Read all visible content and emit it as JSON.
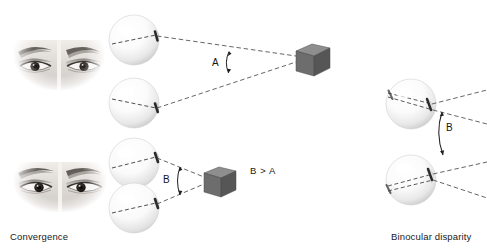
{
  "figure": {
    "background_color": "#ffffff",
    "width": 487,
    "height": 248
  },
  "panels": [
    {
      "id": "convergence",
      "caption": "Convergence",
      "caption_position": {
        "x": 10,
        "y": 231
      },
      "rows": [
        {
          "id": "far-target",
          "angle_label": "A",
          "angle_label_position": {
            "x": 212,
            "y": 57
          },
          "eye_photo": {
            "x": 14,
            "y": 18,
            "w": 90,
            "h": 72,
            "alt": "grayscale photograph of a pair of human eyes looking straight ahead"
          },
          "eyeballs": [
            {
              "cx": 134,
              "cy": 40,
              "r": 25
            },
            {
              "cx": 134,
              "cy": 103,
              "r": 25
            }
          ],
          "target_cube": {
            "x": 294,
            "y": 44,
            "size": 26
          }
        },
        {
          "id": "near-target",
          "angle_label": "B",
          "angle_label_position": {
            "x": 163,
            "y": 174
          },
          "eye_photo": {
            "x": 14,
            "y": 150,
            "w": 92,
            "h": 62,
            "alt": "grayscale photograph of a pair of human eyes converged on a near object"
          },
          "eyeballs": [
            {
              "cx": 134,
              "cy": 163,
              "r": 25
            },
            {
              "cx": 134,
              "cy": 208,
              "r": 25
            }
          ],
          "target_cube": {
            "x": 200,
            "y": 168,
            "size": 24
          }
        }
      ],
      "inequality_note": "B > A",
      "inequality_position": {
        "x": 250,
        "y": 165
      }
    },
    {
      "id": "binocular-disparity",
      "caption": "Binocular disparity",
      "caption_position": {
        "x": 391,
        "y": 231
      },
      "angle_label": "B",
      "angle_label_position": {
        "x": 446,
        "y": 122
      },
      "eyeballs": [
        {
          "cx": 411,
          "cy": 104,
          "r": 25
        },
        {
          "cx": 411,
          "cy": 180,
          "r": 25
        }
      ]
    }
  ],
  "colors": {
    "line": "#4a4a4a",
    "cube_front": "#6e6e6e",
    "cube_top": "#8c8c8c",
    "cube_side": "#545454",
    "eyeball_light": "#ffffff",
    "eyeball_shade": "#c9c9c9",
    "text": "#1a1a1a"
  },
  "icons": {
    "eye_photo": "eye-photo-icon",
    "eyeball": "eyeball-icon",
    "cube": "cube-target-icon",
    "angle_arc": "angle-arc-icon",
    "sight_line": "dashed-sight-line-icon"
  }
}
